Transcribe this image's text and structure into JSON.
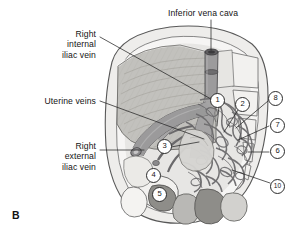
{
  "figure": {
    "panel_letter": "B",
    "background": "#ffffff",
    "width": 296,
    "height": 243
  },
  "labels": [
    {
      "id": "inferior-vena-cava",
      "text": "Inferior vena cava",
      "x": 168,
      "y": 8,
      "align": "left",
      "leader": [
        [
          211,
          20
        ],
        [
          211,
          52
        ]
      ]
    },
    {
      "id": "right-internal-iliac-vein",
      "text": "Right\ninternal\niliac vein",
      "x": 22,
      "y": 29,
      "align": "right",
      "width": 74,
      "leader": [
        [
          100,
          37
        ],
        [
          211,
          99
        ]
      ]
    },
    {
      "id": "uterine-veins",
      "text": "Uterine veins",
      "x": 18,
      "y": 96,
      "align": "right",
      "width": 78,
      "leader": [
        [
          100,
          101
        ],
        [
          204,
          139
        ]
      ]
    },
    {
      "id": "right-external-iliac-vein",
      "text": "Right\nexternal\niliac vein",
      "x": 22,
      "y": 141,
      "align": "right",
      "width": 74,
      "leader": [
        [
          100,
          150
        ],
        [
          146,
          150
        ]
      ]
    }
  ],
  "callouts": [
    {
      "number": "1",
      "x": 216,
      "y": 99,
      "leader": [
        [
          221,
          106
        ],
        [
          219,
          124
        ]
      ]
    },
    {
      "number": "2",
      "x": 241,
      "y": 103,
      "leader": [
        [
          240,
          110
        ],
        [
          226,
          131
        ]
      ]
    },
    {
      "number": "8",
      "x": 274,
      "y": 97,
      "leader": [
        [
          269,
          103
        ],
        [
          238,
          128
        ]
      ]
    },
    {
      "number": "7",
      "x": 276,
      "y": 124,
      "leader": [
        [
          270,
          127
        ],
        [
          239,
          140
        ]
      ]
    },
    {
      "number": "6",
      "x": 276,
      "y": 150,
      "leader": [
        [
          270,
          152
        ],
        [
          249,
          152
        ]
      ]
    },
    {
      "number": "10",
      "x": 277,
      "y": 185,
      "leader": [
        [
          271,
          183
        ],
        [
          232,
          170
        ]
      ]
    },
    {
      "number": "3",
      "x": 163,
      "y": 145,
      "leader": [
        [
          170,
          148
        ],
        [
          200,
          142
        ]
      ]
    },
    {
      "number": "4",
      "x": 152,
      "y": 174,
      "leader": []
    },
    {
      "number": "5",
      "x": 158,
      "y": 193,
      "leader": []
    }
  ],
  "colors": {
    "outline": "#4a4a4a",
    "line": "#2b2b2b",
    "bone_light": "#ececea",
    "bone_mid": "#d8d7d3",
    "muscle_light": "#c9c8c4",
    "muscle_mid": "#b2b1ad",
    "muscle_dark": "#8e8d89",
    "vessel": "#9a999a",
    "vessel_dark": "#6f6e70",
    "plexus": "#7b7a7c",
    "text": "#141414"
  }
}
